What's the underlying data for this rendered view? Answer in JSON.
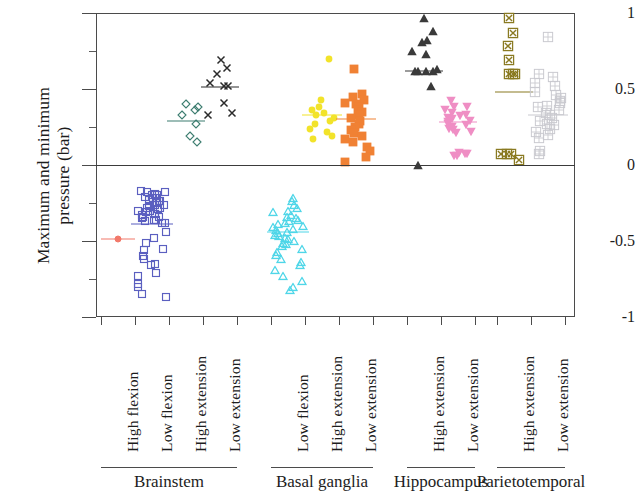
{
  "axes": {
    "y_title": "Maximum and minimum\npressure (bar)",
    "y_ticks": [
      "1",
      "0.5",
      "0",
      "-0.5",
      "-1"
    ],
    "y_tick_values": [
      1,
      0.5,
      0,
      -0.5,
      -1
    ],
    "ylim": [
      -1,
      1
    ]
  },
  "groups": [
    {
      "name": "Brainstem",
      "label": "Brainstem"
    },
    {
      "name": "Basal ganglia",
      "label": "Basal ganglia"
    },
    {
      "name": "Hippocampus",
      "label": "Hippocampus"
    },
    {
      "name": "Parietotemporal",
      "label": "Parietotemporal"
    }
  ],
  "chart_data": {
    "type": "scatter",
    "title": "",
    "xlabel": "",
    "ylabel": "Maximum and minimum pressure (bar)",
    "ylim": [
      -1,
      1
    ],
    "yticks": [
      -1,
      -0.5,
      0,
      0.5,
      1
    ],
    "grid": false,
    "legend": "none",
    "note": "Strip/jitter plot; horizontal bar in each column marks the group mean.",
    "series": [
      {
        "name": "Brainstem High flexion",
        "group": "Brainstem",
        "condition": "High flexion",
        "marker": "circle",
        "color": "#f2796a",
        "mean": -0.49,
        "values": [
          -0.49
        ]
      },
      {
        "name": "Brainstem Low flexion",
        "group": "Brainstem",
        "condition": "Low flexion",
        "marker": "square-open",
        "color": "#5b5fc0",
        "mean": -0.39,
        "values": [
          -0.17,
          -0.18,
          -0.18,
          -0.19,
          -0.2,
          -0.2,
          -0.21,
          -0.22,
          -0.22,
          -0.23,
          -0.24,
          -0.24,
          -0.25,
          -0.26,
          -0.26,
          -0.27,
          -0.28,
          -0.28,
          -0.29,
          -0.3,
          -0.3,
          -0.31,
          -0.32,
          -0.32,
          -0.33,
          -0.34,
          -0.34,
          -0.35,
          -0.36,
          -0.36,
          -0.37,
          -0.38,
          -0.38,
          -0.44,
          -0.48,
          -0.51,
          -0.55,
          -0.56,
          -0.6,
          -0.62,
          -0.65,
          -0.66,
          -0.71,
          -0.73,
          -0.78,
          -0.8,
          -0.85,
          -0.87
        ]
      },
      {
        "name": "Brainstem High extension",
        "group": "Brainstem",
        "condition": "High extension",
        "marker": "diamond-open",
        "color": "#3d7d70",
        "mean": 0.29,
        "values": [
          0.38,
          0.4,
          0.36,
          0.33,
          0.27,
          0.19,
          0.15
        ]
      },
      {
        "name": "Brainstem Low extension",
        "group": "Brainstem",
        "condition": "Low extension",
        "marker": "cross",
        "color": "#2b2b2b",
        "mean": 0.51,
        "values": [
          0.69,
          0.64,
          0.6,
          0.54,
          0.52,
          0.52,
          0.41,
          0.34,
          0.33
        ]
      },
      {
        "name": "Basal ganglia Low flexion",
        "group": "Basal ganglia",
        "condition": "Low flexion",
        "marker": "triangle-up-open",
        "color": "#4fd6e8",
        "mean": -0.44,
        "values": [
          -0.22,
          -0.24,
          -0.26,
          -0.28,
          -0.3,
          -0.31,
          -0.33,
          -0.34,
          -0.35,
          -0.36,
          -0.37,
          -0.38,
          -0.39,
          -0.4,
          -0.41,
          -0.42,
          -0.43,
          -0.44,
          -0.45,
          -0.46,
          -0.47,
          -0.48,
          -0.49,
          -0.5,
          -0.51,
          -0.52,
          -0.53,
          -0.55,
          -0.57,
          -0.59,
          -0.62,
          -0.64,
          -0.66,
          -0.69,
          -0.73,
          -0.76,
          -0.8,
          -0.82
        ]
      },
      {
        "name": "Basal ganglia High extension",
        "group": "Basal ganglia",
        "condition": "High extension",
        "marker": "circle-filled",
        "color": "#f2e32a",
        "mean": 0.33,
        "values": [
          0.7,
          0.43,
          0.38,
          0.36,
          0.34,
          0.33,
          0.31,
          0.29,
          0.27,
          0.24,
          0.22,
          0.19,
          0.17
        ]
      },
      {
        "name": "Basal ganglia Low extension",
        "group": "Basal ganglia",
        "condition": "Low extension",
        "marker": "square-filled",
        "color": "#f08134",
        "mean": 0.3,
        "values": [
          0.63,
          0.47,
          0.45,
          0.43,
          0.41,
          0.4,
          0.38,
          0.36,
          0.35,
          0.33,
          0.31,
          0.29,
          0.27,
          0.25,
          0.23,
          0.21,
          0.19,
          0.17,
          0.15,
          0.12,
          0.09,
          0.05,
          0.02
        ]
      },
      {
        "name": "Hippocampus High extension",
        "group": "Hippocampus",
        "condition": "High extension",
        "marker": "triangle-up-filled",
        "color": "#3a3a3a",
        "mean": 0.62,
        "values": [
          0.97,
          0.88,
          0.82,
          0.81,
          0.73,
          0.75,
          0.63,
          0.62,
          0.62,
          0.62,
          0.62,
          0.52,
          0.0
        ]
      },
      {
        "name": "Hippocampus Low extension",
        "group": "Hippocampus",
        "condition": "Low extension",
        "marker": "triangle-down-filled",
        "color": "#ef8ec4",
        "mean": 0.28,
        "values": [
          0.42,
          0.38,
          0.38,
          0.36,
          0.34,
          0.33,
          0.32,
          0.31,
          0.3,
          0.29,
          0.28,
          0.27,
          0.26,
          0.25,
          0.24,
          0.23,
          0.22,
          0.21,
          0.08,
          0.07,
          0.07,
          0.06,
          0.06
        ]
      },
      {
        "name": "Parietotemporal High extension",
        "group": "Parietotemporal",
        "condition": "High extension",
        "marker": "square-x",
        "color": "#8a7a22",
        "mean": 0.48,
        "values": [
          0.97,
          0.87,
          0.78,
          0.69,
          0.6,
          0.6,
          0.6,
          0.07,
          0.07,
          0.07,
          0.03
        ]
      },
      {
        "name": "Parietotemporal Low extension",
        "group": "Parietotemporal",
        "condition": "Low extension",
        "marker": "square-grid",
        "color": "#c9c9cf",
        "mean": 0.33,
        "values": [
          0.84,
          0.6,
          0.58,
          0.54,
          0.52,
          0.48,
          0.46,
          0.44,
          0.42,
          0.41,
          0.39,
          0.38,
          0.36,
          0.34,
          0.33,
          0.31,
          0.29,
          0.27,
          0.26,
          0.24,
          0.22,
          0.2,
          0.18,
          0.09,
          0.07
        ]
      }
    ]
  },
  "columns": [
    {
      "label": "High flexion",
      "group": "Brainstem"
    },
    {
      "label": "Low flexion",
      "group": "Brainstem"
    },
    {
      "label": "High extension",
      "group": "Brainstem"
    },
    {
      "label": "Low extension",
      "group": "Brainstem"
    },
    {
      "label": "Low flexion",
      "group": "Basal ganglia"
    },
    {
      "label": "High extension",
      "group": "Basal ganglia"
    },
    {
      "label": "Low extension",
      "group": "Basal ganglia"
    },
    {
      "label": "High extension",
      "group": "Hippocampus"
    },
    {
      "label": "Low extension",
      "group": "Hippocampus"
    },
    {
      "label": "High extension",
      "group": "Parietotemporal"
    },
    {
      "label": "Low extension",
      "group": "Parietotemporal"
    }
  ]
}
